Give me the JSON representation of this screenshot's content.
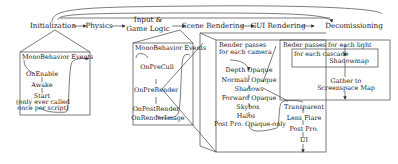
{
  "pipeline": {
    "stages": [
      {
        "label": "Initialization"
      },
      {
        "label": "Physics"
      },
      {
        "label_line1": "Input &",
        "label_line2": "Game Logic"
      },
      {
        "label": "Scene Rendering"
      },
      {
        "label": "GUI Rendering"
      },
      {
        "label": "Decomissioning"
      }
    ]
  },
  "init_box": {
    "title": "MonoBehavior Events",
    "items": [
      "OnEnable",
      "Awake",
      "Start"
    ],
    "note_line1": "(only ever called",
    "note_line2": "once per script)"
  },
  "scene_box": {
    "title": "MonoBehavior Events",
    "items": [
      "OnPreCull",
      "OnPreRender",
      "OnPostRender",
      "OnRenderImage"
    ]
  },
  "camera_box": {
    "title_line1": "Render passes",
    "title_line2": "for each camera",
    "passes": [
      "Depth Opaque",
      "Normals Opaque",
      "Shadows",
      "Forward Opaque",
      "Skybox",
      "Halos",
      "Post Pro. Opaque-only"
    ],
    "transparent_passes": [
      "Transparent",
      "Lens Flare",
      "Post Pro.",
      "UI"
    ]
  },
  "light_box": {
    "title": "Reder passes for each light",
    "cascade_label": "for each cascade",
    "shadowmap": "Shadowmap",
    "gather_line1": "Gather to",
    "gather_line2": "Screenspace Map"
  }
}
